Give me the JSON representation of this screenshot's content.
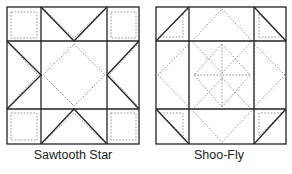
{
  "diagrams": [
    {
      "name": "sawtooth-star",
      "label": "Sawtooth Star"
    },
    {
      "name": "shoo-fly",
      "label": "Shoo-Fly"
    }
  ],
  "colors": {
    "line": "#222222",
    "dotted": "#888888",
    "background": "#ffffff"
  }
}
